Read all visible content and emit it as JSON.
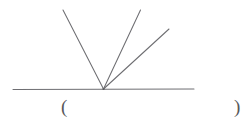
{
  "figure": {
    "name": "angle-rays-diagram",
    "stroke_color": "#6e6e72",
    "background_color": "#ffffff",
    "baseline": {
      "label": "baseline",
      "x1": 13,
      "y1": 89.5,
      "x2": 194,
      "y2": 89.0
    },
    "vertex": {
      "label": "vertex",
      "x": 103.5,
      "y": 89.0
    },
    "rays": [
      {
        "label": "ray-left",
        "x1": 103.5,
        "y1": 89.0,
        "x2": 63.0,
        "y2": 10.0
      },
      {
        "label": "ray-middle",
        "x1": 103.5,
        "y1": 89.0,
        "x2": 140.5,
        "y2": 10.0
      },
      {
        "label": "ray-right",
        "x1": 103.5,
        "y1": 89.0,
        "x2": 169.0,
        "y2": 29.0
      }
    ]
  },
  "answer": {
    "open_paren": "(",
    "close_paren": ")",
    "value": "",
    "placeholder": ""
  }
}
